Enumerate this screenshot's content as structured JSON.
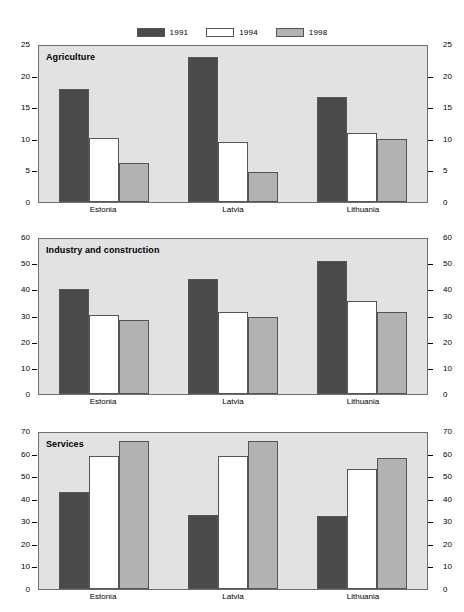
{
  "legend": {
    "items": [
      {
        "label": "1991",
        "color": "#4a4a4a",
        "key": "y1991"
      },
      {
        "label": "1994",
        "color": "#ffffff",
        "key": "y1994"
      },
      {
        "label": "1998",
        "color": "#b2b2b2",
        "key": "y1998"
      }
    ]
  },
  "colors": {
    "series_1991": "#4a4a4a",
    "series_1994": "#ffffff",
    "series_1998": "#b2b2b2",
    "plot_background": "#e2e2e2",
    "axis": "#000000",
    "page_background": "#ffffff"
  },
  "categories": [
    "Estonia",
    "Latvia",
    "Lithuania"
  ],
  "chart_data": [
    {
      "type": "bar",
      "title": "Agriculture",
      "xlabel": "",
      "ylabel": "",
      "ylim": [
        0,
        25
      ],
      "yticks": [
        0,
        5,
        10,
        15,
        20,
        25
      ],
      "grid": false,
      "legend_position": "top-center",
      "dual_axis": true,
      "categories": [
        "Estonia",
        "Latvia",
        "Lithuania"
      ],
      "series": [
        {
          "name": "1991",
          "values": [
            17.9,
            23.0,
            16.6
          ]
        },
        {
          "name": "1994",
          "values": [
            10.2,
            9.5,
            10.9
          ]
        },
        {
          "name": "1998",
          "values": [
            6.2,
            4.7,
            9.9
          ]
        }
      ]
    },
    {
      "type": "bar",
      "title": "Industry and construction",
      "xlabel": "",
      "ylabel": "",
      "ylim": [
        0,
        60
      ],
      "yticks": [
        0,
        10,
        20,
        30,
        40,
        50,
        60
      ],
      "grid": false,
      "legend_position": "top-center",
      "dual_axis": true,
      "categories": [
        "Estonia",
        "Latvia",
        "Lithuania"
      ],
      "series": [
        {
          "name": "1991",
          "values": [
            40.2,
            44.0,
            50.8
          ]
        },
        {
          "name": "1994",
          "values": [
            30.3,
            31.2,
            35.4
          ]
        },
        {
          "name": "1998",
          "values": [
            28.1,
            29.4,
            31.5
          ]
        }
      ]
    },
    {
      "type": "bar",
      "title": "Services",
      "xlabel": "",
      "ylabel": "",
      "ylim": [
        0,
        70
      ],
      "yticks": [
        0,
        10,
        20,
        30,
        40,
        50,
        60,
        70
      ],
      "grid": false,
      "legend_position": "top-center",
      "dual_axis": true,
      "categories": [
        "Estonia",
        "Latvia",
        "Lithuania"
      ],
      "series": [
        {
          "name": "1991",
          "values": [
            43.0,
            32.7,
            32.2
          ]
        },
        {
          "name": "1994",
          "values": [
            59.0,
            59.0,
            53.0
          ]
        },
        {
          "name": "1998",
          "values": [
            65.5,
            65.7,
            58.2
          ]
        }
      ]
    }
  ],
  "layout": {
    "panels": [
      {
        "plot_top": 45,
        "plot_height": 158,
        "labels_y": 205
      },
      {
        "plot_top": 238,
        "plot_height": 157,
        "labels_y": 397
      },
      {
        "plot_top": 432,
        "plot_height": 158,
        "labels_y": 592
      }
    ]
  }
}
